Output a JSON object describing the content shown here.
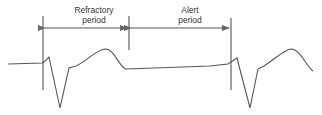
{
  "diagram": {
    "labels": {
      "refractory_line1": "Refractory",
      "refractory_line2": "period",
      "alert_line1": "Alert",
      "alert_line2": "period"
    },
    "colors": {
      "stroke": "#555555",
      "text": "#333333"
    }
  }
}
